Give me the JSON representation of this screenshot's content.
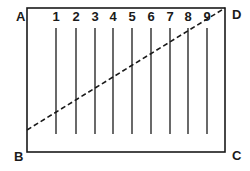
{
  "diagram": {
    "corners": {
      "A": {
        "label": "A",
        "x": 16,
        "y": 21
      },
      "B": {
        "label": "B",
        "x": 14,
        "y": 161
      },
      "C": {
        "label": "C",
        "x": 232,
        "y": 160
      },
      "D": {
        "label": "D",
        "x": 232,
        "y": 19
      }
    },
    "rectangle": {
      "x1": 27,
      "y1": 8,
      "x2": 225,
      "y2": 152
    },
    "lines": [
      {
        "label": "1",
        "x": 56
      },
      {
        "label": "2",
        "x": 76
      },
      {
        "label": "3",
        "x": 95
      },
      {
        "label": "4",
        "x": 113
      },
      {
        "label": "5",
        "x": 132
      },
      {
        "label": "6",
        "x": 151
      },
      {
        "label": "7",
        "x": 170
      },
      {
        "label": "8",
        "x": 188
      },
      {
        "label": "9",
        "x": 207
      }
    ],
    "line_top": 28,
    "line_bottom": 134,
    "number_label_y": 21,
    "diagonal": {
      "x1": 27,
      "y1": 130,
      "x2": 225,
      "y2": 8,
      "style": "dashed"
    },
    "colors": {
      "stroke": "#1a1a1a",
      "background": "#ffffff"
    }
  }
}
